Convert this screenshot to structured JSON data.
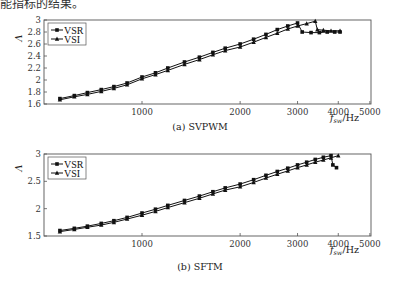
{
  "header": {
    "text": "能指标的结果。"
  },
  "charts": [
    {
      "id": "a",
      "caption": "(a) SVPWM",
      "ylabel": "Λ",
      "xlabel_main": "f",
      "xlabel_sub": "sw",
      "xlabel_unit": "/Hz",
      "yticks": [
        "1.6",
        "1.8",
        "2",
        "2.2",
        "2.4",
        "2.6",
        "2.8",
        "3"
      ],
      "xticks": [
        "1000",
        "2000",
        "3000",
        "4000",
        "5000"
      ],
      "legend": [
        "VSR",
        "VSI"
      ]
    },
    {
      "id": "b",
      "caption": "(b) SFTM",
      "ylabel": "Λ",
      "xlabel_main": "f",
      "xlabel_sub": "sw",
      "xlabel_unit": "/Hz",
      "yticks": [
        "1.5",
        "2",
        "2.5",
        "3"
      ],
      "xticks": [
        "1000",
        "2000",
        "3000",
        "4000",
        "5000"
      ],
      "legend": [
        "VSR",
        "VSI"
      ]
    }
  ],
  "chart_data": [
    {
      "type": "line",
      "title": "(a) SVPWM",
      "xlabel": "f_sw/Hz",
      "ylabel": "Λ",
      "xscale": "log",
      "xlim": [
        512,
        5000
      ],
      "ylim": [
        1.6,
        3.0
      ],
      "xticks": [
        1000,
        2000,
        3000,
        4000,
        5000
      ],
      "yticks": [
        1.6,
        1.8,
        2.0,
        2.2,
        2.4,
        2.6,
        2.8,
        3.0
      ],
      "legend_position": "upper left",
      "series": [
        {
          "name": "VSR",
          "marker": "square",
          "x": [
            560,
            620,
            680,
            750,
            820,
            900,
            1000,
            1100,
            1200,
            1350,
            1500,
            1650,
            1800,
            2000,
            2200,
            2400,
            2600,
            2800,
            3000,
            3100,
            3300,
            3500,
            3700,
            3900,
            4050
          ],
          "y": [
            1.69,
            1.74,
            1.79,
            1.84,
            1.89,
            1.95,
            2.05,
            2.12,
            2.2,
            2.3,
            2.38,
            2.46,
            2.53,
            2.6,
            2.68,
            2.76,
            2.84,
            2.9,
            2.95,
            2.8,
            2.79,
            2.79,
            2.8,
            2.8,
            2.8
          ]
        },
        {
          "name": "VSI",
          "marker": "triangle",
          "x": [
            560,
            620,
            680,
            750,
            820,
            900,
            1000,
            1100,
            1200,
            1350,
            1500,
            1650,
            1800,
            2000,
            2200,
            2400,
            2600,
            2800,
            3000,
            3200,
            3400,
            3450,
            3600,
            3800,
            4050
          ],
          "y": [
            1.67,
            1.72,
            1.76,
            1.81,
            1.86,
            1.92,
            2.02,
            2.09,
            2.16,
            2.26,
            2.34,
            2.42,
            2.49,
            2.55,
            2.63,
            2.71,
            2.78,
            2.85,
            2.9,
            2.94,
            2.98,
            2.84,
            2.83,
            2.82,
            2.82
          ]
        }
      ]
    },
    {
      "type": "line",
      "title": "(b) SFTM",
      "xlabel": "f_sw/Hz",
      "ylabel": "Λ",
      "xscale": "log",
      "xlim": [
        512,
        5000
      ],
      "ylim": [
        1.5,
        3.0
      ],
      "xticks": [
        1000,
        2000,
        3000,
        4000,
        5000
      ],
      "yticks": [
        1.5,
        2.0,
        2.5,
        3.0
      ],
      "legend_position": "upper left",
      "series": [
        {
          "name": "VSR",
          "marker": "square",
          "x": [
            560,
            620,
            680,
            750,
            820,
            900,
            1000,
            1100,
            1200,
            1350,
            1500,
            1650,
            1800,
            2000,
            2200,
            2400,
            2600,
            2800,
            3000,
            3200,
            3400,
            3600,
            3800,
            3850,
            3950
          ],
          "y": [
            1.6,
            1.64,
            1.68,
            1.73,
            1.78,
            1.84,
            1.92,
            1.99,
            2.06,
            2.15,
            2.23,
            2.31,
            2.38,
            2.45,
            2.53,
            2.61,
            2.68,
            2.74,
            2.8,
            2.85,
            2.9,
            2.94,
            2.97,
            2.8,
            2.75
          ]
        },
        {
          "name": "VSI",
          "marker": "triangle",
          "x": [
            560,
            620,
            680,
            750,
            820,
            900,
            1000,
            1100,
            1200,
            1350,
            1500,
            1650,
            1800,
            2000,
            2200,
            2400,
            2600,
            2800,
            3000,
            3200,
            3400,
            3600,
            3800,
            4000
          ],
          "y": [
            1.58,
            1.62,
            1.66,
            1.7,
            1.75,
            1.81,
            1.88,
            1.95,
            2.02,
            2.11,
            2.19,
            2.27,
            2.34,
            2.4,
            2.48,
            2.56,
            2.63,
            2.69,
            2.75,
            2.8,
            2.85,
            2.89,
            2.93,
            2.97
          ]
        }
      ]
    }
  ]
}
